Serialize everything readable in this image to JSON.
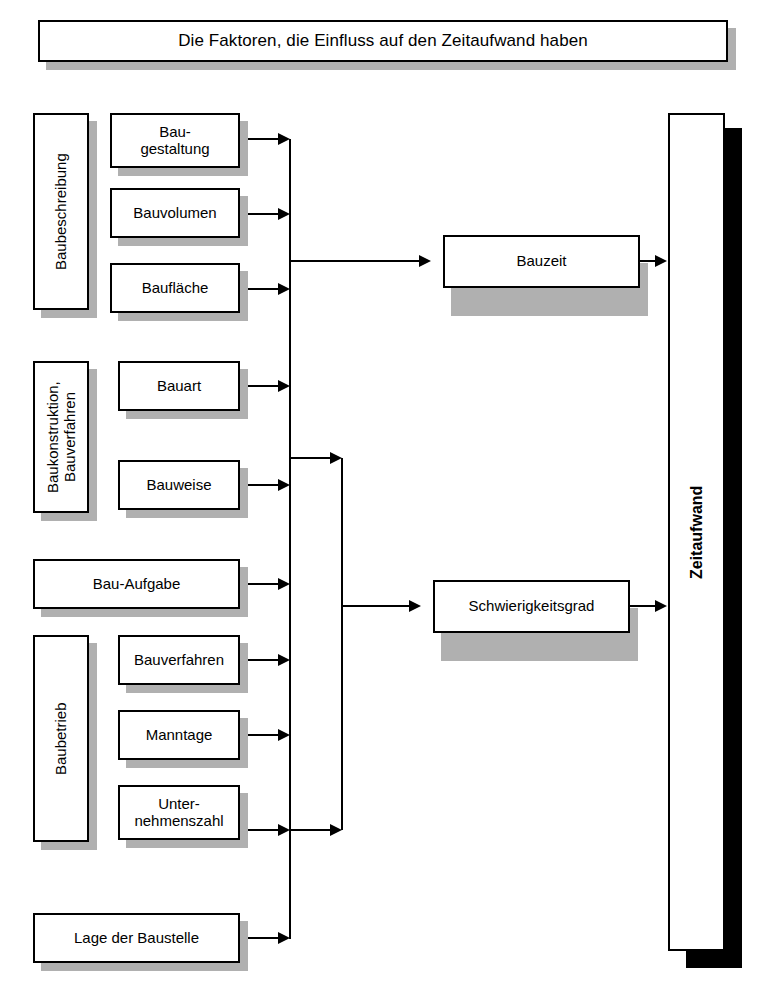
{
  "title": {
    "text": "Die Faktoren, die Einfluss auf den Zeitaufwand haben"
  },
  "groups": [
    {
      "label": "Baubeschreibung",
      "factors": [
        "Bau-\ngestaltung",
        "Bauvolumen",
        "Baufläche"
      ]
    },
    {
      "label": "Baukonstruktion,\nBauverfahren",
      "factors": [
        "Bauart",
        "Bauweise"
      ]
    },
    {
      "label": "Baubetrieb",
      "factors": [
        "Bauverfahren",
        "Manntage",
        "Unter-\nnehmenszahl"
      ]
    }
  ],
  "standalone_factors": [
    "Bau-Aufgabe",
    "Lage der Baustelle"
  ],
  "intermediate": [
    "Bauzeit",
    "Schwierigkeitsgrad"
  ],
  "result": {
    "label": "Zeitaufwand"
  },
  "colors": {
    "shadow_gray": "#b0b0b0",
    "shadow_black": "#000000",
    "line": "#000000",
    "box_fill": "#ffffff"
  }
}
